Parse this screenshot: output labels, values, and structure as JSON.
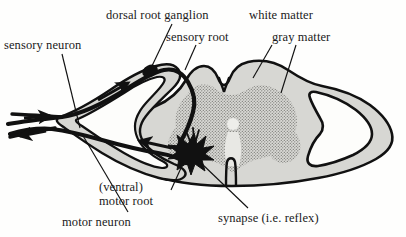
{
  "figure": {
    "background_color": "#fefefd",
    "ink_color": "#111111"
  },
  "labels": {
    "sensory_neuron": "sensory neuron",
    "dorsal_root_ganglion": "dorsal root ganglion",
    "sensory_root": "sensory root",
    "white_matter": "white matter",
    "gray_matter": "gray matter",
    "ventral_root_line1": "(ventral)",
    "ventral_root_line2": "motor root",
    "motor_neuron": "motor neuron",
    "synapse": "synapse (i.e. reflex)"
  },
  "anatomy": {
    "white_matter_fill": "#d6d6d2",
    "gray_matter_fill": "#bdbdb8",
    "nerve_stroke": "#111111",
    "outline_stroke": "#111111",
    "central_canal": "central canal",
    "structures": [
      "spinal cord outline",
      "gray matter butterfly",
      "central canal",
      "dorsal median sulcus",
      "ventral median fissure",
      "left spinal nerve loop",
      "right spinal nerve loop",
      "dorsal root ganglion",
      "sensory root",
      "ventral motor root",
      "synapse starburst",
      "peripheral nerve branches"
    ],
    "arrows": [
      {
        "name": "sensory-afferent-peripheral",
        "direction": "toward cord"
      },
      {
        "name": "sensory-afferent-dorsal",
        "direction": "toward cord"
      },
      {
        "name": "motor-efferent-ventral",
        "direction": "away from cord"
      },
      {
        "name": "motor-efferent-peripheral",
        "direction": "away from cord"
      }
    ]
  }
}
